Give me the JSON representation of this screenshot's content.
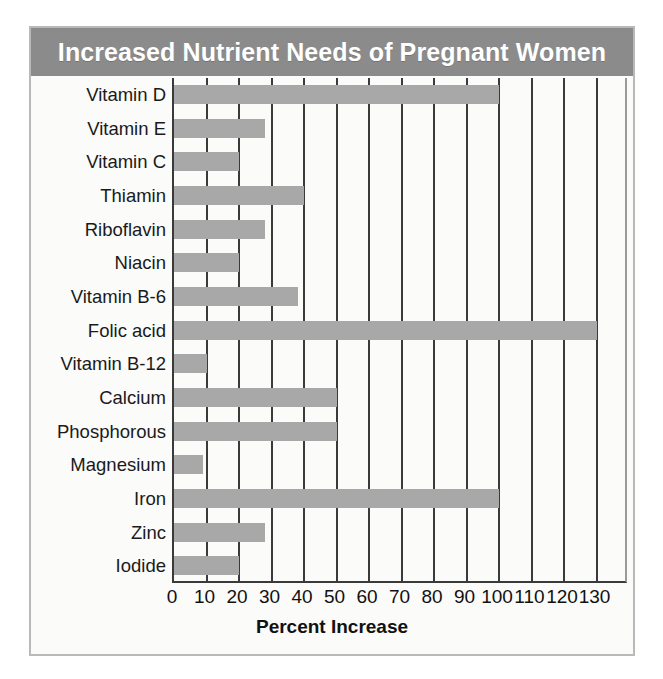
{
  "figure": {
    "title": "Increased Nutrient Needs of Pregnant Women",
    "banner_color": "#8b8b8b",
    "bar_color": "#a8a8a8",
    "frame_color": "#b9b9b9",
    "background": "#fbfbfa"
  },
  "chart_data": {
    "type": "bar",
    "orientation": "horizontal",
    "title": "Increased Nutrient Needs of Pregnant Women",
    "xlabel": "Percent Increase",
    "ylabel": "",
    "xlim": [
      0,
      140
    ],
    "xticks": [
      0,
      10,
      20,
      30,
      40,
      50,
      60,
      70,
      80,
      90,
      100,
      110,
      120,
      130
    ],
    "xtick_labels": [
      "0",
      "10",
      "20",
      "30",
      "40",
      "50",
      "60",
      "70",
      "80",
      "90",
      "100",
      "110",
      "120",
      "130"
    ],
    "grid": true,
    "grid_axis": "x",
    "legend": false,
    "categories": [
      "Vitamin D",
      "Vitamin E",
      "Vitamin C",
      "Thiamin",
      "Riboflavin",
      "Niacin",
      "Vitamin B-6",
      "Folic acid",
      "Vitamin B-12",
      "Calcium",
      "Phosphorous",
      "Magnesium",
      "Iron",
      "Zinc",
      "Iodide"
    ],
    "values": [
      100,
      28,
      20,
      40,
      28,
      20,
      38,
      130,
      10,
      50,
      50,
      9,
      100,
      28,
      20
    ],
    "units": "percent"
  }
}
